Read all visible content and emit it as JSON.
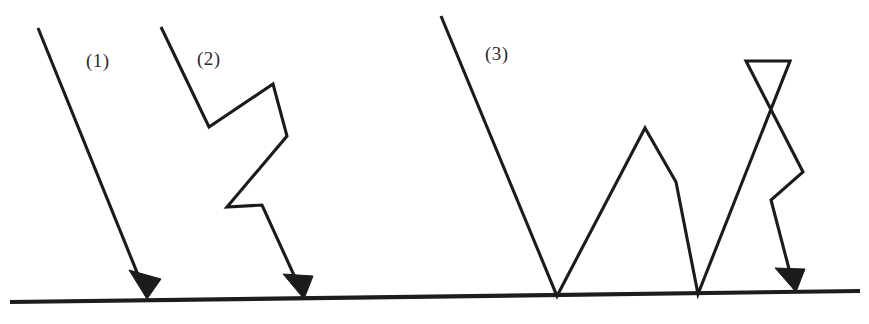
{
  "figure": {
    "width": 869,
    "height": 324,
    "background_color": "#ffffff",
    "stroke_color": "#1b1b1b",
    "label_color": "#2a2a33"
  },
  "surface": {
    "name": "ground-surface-line",
    "start": [
      10,
      302
    ],
    "end": [
      860,
      291
    ],
    "stroke_width": 4.2
  },
  "rays": [
    {
      "id": "ray-1",
      "label": "(1)",
      "label_x": 86,
      "label_y": 50,
      "points": [
        [
          38,
          28
        ],
        [
          147,
          297
        ]
      ],
      "arrow": {
        "tip": [
          147,
          299
        ],
        "left": [
          129,
          270
        ],
        "right": [
          161,
          279
        ]
      }
    },
    {
      "id": "ray-2",
      "label": "(2)",
      "label_x": 197,
      "label_y": 48,
      "points": [
        [
          161,
          27
        ],
        [
          209,
          127
        ],
        [
          273,
          84
        ],
        [
          287,
          136
        ],
        [
          227,
          207
        ],
        [
          262,
          205
        ],
        [
          303,
          295
        ]
      ],
      "arrow": {
        "tip": [
          304,
          299
        ],
        "left": [
          283,
          274
        ],
        "right": [
          313,
          276
        ]
      }
    },
    {
      "id": "ray-3",
      "label": "(3)",
      "label_x": 485,
      "label_y": 43,
      "points": [
        [
          441,
          16
        ],
        [
          557,
          296
        ],
        [
          645,
          128
        ],
        [
          676,
          182
        ],
        [
          698,
          294
        ],
        [
          790,
          61
        ],
        [
          746,
          61
        ],
        [
          803,
          172
        ],
        [
          771,
          200
        ],
        [
          794,
          288
        ]
      ],
      "arrow": {
        "tip": [
          796,
          292
        ],
        "left": [
          775,
          268
        ],
        "right": [
          805,
          269
        ]
      }
    }
  ],
  "labels": {
    "ray_1": "(1)",
    "ray_2": "(2)",
    "ray_3": "(3)"
  }
}
